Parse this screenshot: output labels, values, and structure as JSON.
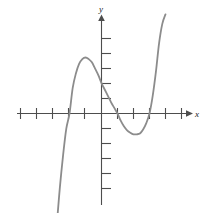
{
  "figure": {
    "background_color": "#ffffff",
    "width": 209,
    "height": 213
  },
  "axes": {
    "x_axis_label": "x",
    "y_axis_label": "y",
    "axis_color": "#4d4d4d",
    "tick_color": "#4d4d4d",
    "arrowheads": "both-positive-ends",
    "grid": "off",
    "tick_labels_shown": "none"
  },
  "chart_data": {
    "type": "line",
    "title": "",
    "subtitle": "",
    "xlabel": "x",
    "ylabel": "y",
    "curve_color": "#8c8c8c",
    "line_width": 1.8,
    "grid": false,
    "legend": "none",
    "xlim": [
      -5.4,
      5.4
    ],
    "ylim": [
      -6.4,
      6.2
    ],
    "x_ticks": [
      -5,
      -4,
      -3,
      -2,
      -1,
      1,
      2,
      3,
      4,
      5
    ],
    "y_ticks": [
      -6,
      -5,
      -4,
      -3,
      -2,
      -1,
      1,
      2,
      3,
      4,
      5
    ],
    "x_intercepts": [
      -2.0,
      1.0,
      3.4
    ],
    "y_intercept": 1.9,
    "local_maximum": {
      "x": -1.0,
      "y": 3.5
    },
    "local_minimum": {
      "x": 2.4,
      "y": -1.3
    },
    "series": [
      {
        "name": "cubic",
        "x": [
          -2.75,
          -2.6,
          -2.4,
          -2.2,
          -2.0,
          -1.8,
          -1.6,
          -1.4,
          -1.2,
          -1.0,
          -0.8,
          -0.6,
          -0.4,
          -0.2,
          0.0,
          0.2,
          0.4,
          0.6,
          0.8,
          1.0,
          1.2,
          1.4,
          1.6,
          1.8,
          2.0,
          2.2,
          2.4,
          2.6,
          2.8,
          3.0,
          3.2,
          3.4,
          3.6,
          3.8,
          4.0
        ],
        "y": [
          -6.4,
          -4.6,
          -2.6,
          -0.95,
          0.0,
          1.6,
          2.5,
          3.1,
          3.4,
          3.5,
          3.4,
          3.2,
          2.8,
          2.4,
          1.9,
          1.5,
          1.1,
          0.7,
          0.35,
          0.0,
          -0.45,
          -0.8,
          -1.05,
          -1.2,
          -1.3,
          -1.3,
          -1.25,
          -1.0,
          -0.6,
          0.0,
          1.1,
          2.6,
          4.4,
          5.6,
          6.2
        ]
      }
    ]
  }
}
